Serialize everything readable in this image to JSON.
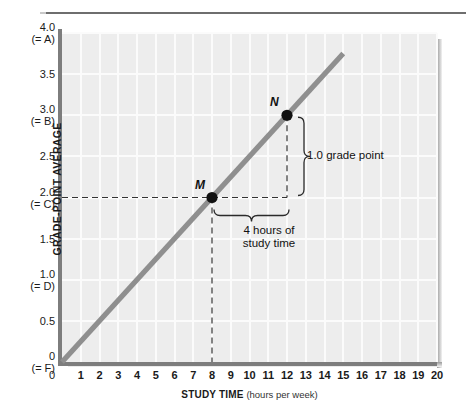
{
  "chart_data": {
    "type": "line",
    "title": "",
    "xlabel_bold": "STUDY TIME",
    "xlabel_unit": "(hours per week)",
    "ylabel": "GRADE-POINT AVERAGE",
    "xlim": [
      0,
      20
    ],
    "ylim": [
      0,
      4.0
    ],
    "grid": true,
    "legend_position": "none",
    "x_ticks": [
      "0",
      "1",
      "2",
      "3",
      "4",
      "5",
      "6",
      "7",
      "8",
      "9",
      "10",
      "11",
      "12",
      "13",
      "14",
      "15",
      "16",
      "17",
      "18",
      "19",
      "20"
    ],
    "y_ticks": [
      {
        "value": "4.0",
        "sub": "(= A)"
      },
      {
        "value": "3.5",
        "sub": ""
      },
      {
        "value": "3.0",
        "sub": "(= B)"
      },
      {
        "value": "2.5",
        "sub": ""
      },
      {
        "value": "2.0",
        "sub": "(= C)"
      },
      {
        "value": "1.5",
        "sub": ""
      },
      {
        "value": "1.0",
        "sub": "(= D)"
      },
      {
        "value": "0.5",
        "sub": ""
      },
      {
        "value": "0",
        "sub": "(= F)"
      }
    ],
    "series": [
      {
        "name": "grade-point average vs study time",
        "color": "#8f8f8f",
        "x": [
          0,
          15
        ],
        "values": [
          0,
          3.75
        ]
      }
    ],
    "points": [
      {
        "label": "M",
        "x": 8,
        "y": 2.0
      },
      {
        "label": "N",
        "x": 12,
        "y": 3.0
      }
    ],
    "annotations": [
      {
        "name": "rise-label",
        "text": "1.0 grade point"
      },
      {
        "name": "run-label-line1",
        "text": "4 hours of"
      },
      {
        "name": "run-label-line2",
        "text": "study time"
      }
    ],
    "colors": {
      "plot_background": "#ededed",
      "gridline": "#fbfbfb",
      "axis": "#7d7d7d",
      "data_line": "#8f8f8f",
      "point_marker": "#111111",
      "dashed_guide": "#333333",
      "text": "#1a1a1a"
    }
  }
}
